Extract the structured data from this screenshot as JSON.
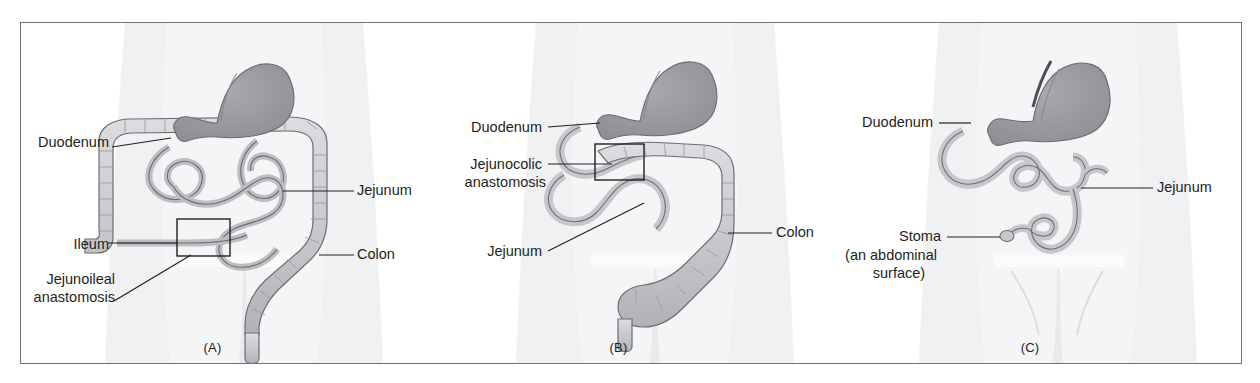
{
  "figure": {
    "type": "anatomical-diagram",
    "panel_count": 3,
    "colors": {
      "border": "#6f7276",
      "background": "#ffffff",
      "body_silhouette": "#ebecee",
      "stomach_fill": "#9b9ca0",
      "intestine_fill": "#c9cacd",
      "outline": "#6d6e71",
      "label_text": "#231f20",
      "leader_line": "#231f20"
    }
  },
  "panels": [
    {
      "id": "panel-a",
      "caption": "(A)",
      "description": "Normal-appearing abdomen with stomach, duodenum, jejunum, ileum and colon; a jejunoileal anastomosis is boxed",
      "labels": [
        {
          "name": "duodenum",
          "text": "Duodenum"
        },
        {
          "name": "ileum",
          "text": "Ileum"
        },
        {
          "name": "jejunoileal-anastomosis",
          "lines": [
            "Jejunoileal",
            "anastomosis"
          ]
        },
        {
          "name": "jejunum",
          "text": "Jejunum"
        },
        {
          "name": "colon",
          "text": "Colon"
        }
      ]
    },
    {
      "id": "panel-b",
      "caption": "(B)",
      "description": "Shortened small intestine joined directly to the colon; a jejunocolic anastomosis is boxed",
      "labels": [
        {
          "name": "duodenum",
          "text": "Duodenum"
        },
        {
          "name": "jejunocolic-anastomosis",
          "lines": [
            "Jejunocolic",
            "anastomosis"
          ]
        },
        {
          "name": "jejunum",
          "text": "Jejunum"
        },
        {
          "name": "colon",
          "text": "Colon"
        }
      ]
    },
    {
      "id": "panel-c",
      "caption": "(C)",
      "description": "Remaining stomach, duodenum and short jejunum ending in a stoma at the abdominal surface; colon absent",
      "labels": [
        {
          "name": "duodenum",
          "text": "Duodenum"
        },
        {
          "name": "jejunum",
          "text": "Jejunum"
        },
        {
          "name": "stoma",
          "lines": [
            "Stoma",
            "(an abdominal",
            "surface)"
          ]
        }
      ]
    }
  ],
  "text": {
    "duodenum": "Duodenum",
    "jejunum": "Jejunum",
    "ileum": "Ileum",
    "colon": "Colon",
    "jejunoileal_1": "Jejunoileal",
    "jejunoileal_2": "anastomosis",
    "jejunocolic_1": "Jejunocolic",
    "jejunocolic_2": "anastomosis",
    "stoma": "Stoma",
    "stoma_sub_1": "(an abdominal",
    "stoma_sub_2": "surface)",
    "caption_a": "(A)",
    "caption_b": "(B)",
    "caption_c": "(C)"
  }
}
